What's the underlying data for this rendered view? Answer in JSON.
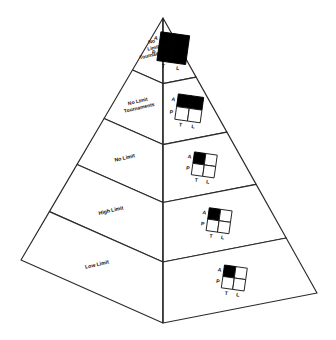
{
  "figure": {
    "type": "pyramid-diagram",
    "orientation": "3d-two-visible-faces",
    "tier_count": 5,
    "colors": {
      "stroke": "#2b2b2b",
      "face_fill": "#ffffff",
      "cell_on": "#000000",
      "cell_off": "#ffffff",
      "text": "#111111"
    }
  },
  "matrix_legend": {
    "row_labels": [
      "A",
      "P"
    ],
    "col_labels": [
      "T",
      "L"
    ],
    "row_axis_name": "A / P",
    "col_axis_name": "T / L",
    "cell_order": [
      "A-T",
      "A-L",
      "P-T",
      "P-L"
    ]
  },
  "tiers": [
    {
      "index": 1,
      "position": "top",
      "label": "No Limit Tournaments",
      "label_lines": [
        "No",
        "Limit",
        "Tournaments"
      ],
      "matrix": {
        "rows": [
          "A",
          "P"
        ],
        "cols": [
          "T",
          "L"
        ],
        "filled": [
          [
            1,
            1
          ],
          [
            1,
            1
          ]
        ],
        "filled_count": 4
      }
    },
    {
      "index": 2,
      "position": "second",
      "label": "No Limit Tournaments",
      "label_lines": [
        "No Limit",
        "Tournaments"
      ],
      "matrix": {
        "rows": [
          "A",
          "P"
        ],
        "cols": [
          "T",
          "L"
        ],
        "filled": [
          [
            1,
            1
          ],
          [
            0,
            0
          ]
        ],
        "filled_count": 2
      }
    },
    {
      "index": 3,
      "position": "middle",
      "label": "No Limit",
      "label_lines": [
        "No Limit"
      ],
      "matrix": {
        "rows": [
          "A",
          "P"
        ],
        "cols": [
          "T",
          "L"
        ],
        "filled": [
          [
            1,
            0
          ],
          [
            0,
            0
          ]
        ],
        "filled_count": 1
      }
    },
    {
      "index": 4,
      "position": "fourth",
      "label": "High Limit",
      "label_lines": [
        "High Limit"
      ],
      "matrix": {
        "rows": [
          "A",
          "P"
        ],
        "cols": [
          "T",
          "L"
        ],
        "filled": [
          [
            1,
            0
          ],
          [
            0,
            0
          ]
        ],
        "filled_count": 1
      }
    },
    {
      "index": 5,
      "position": "bottom",
      "label": "Low Limit",
      "label_lines": [
        "Low Limit"
      ],
      "matrix": {
        "rows": [
          "A",
          "P"
        ],
        "cols": [
          "T",
          "L"
        ],
        "filled": [
          [
            1,
            0
          ],
          [
            0,
            0
          ]
        ],
        "filled_count": 1
      }
    }
  ]
}
